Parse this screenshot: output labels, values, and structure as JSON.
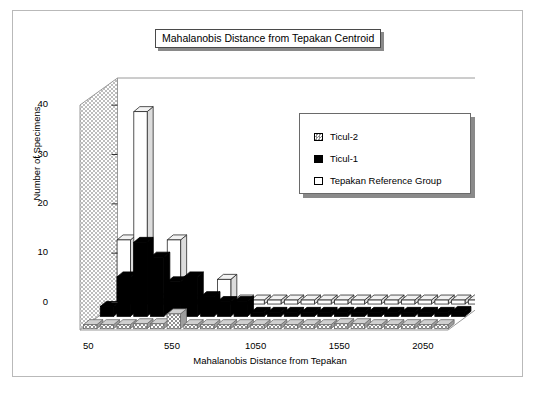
{
  "title": "Mahalanobis Distance from Tepakan Centroid",
  "legend": {
    "items": [
      {
        "label": "Ticul-2",
        "swatch": "gray-hatch",
        "color": "#b4b4b4"
      },
      {
        "label": "Ticul-1",
        "swatch": "black-solid",
        "color": "#000000"
      },
      {
        "label": "Tepakan Reference Group",
        "swatch": "white-open",
        "color": "#ffffff"
      }
    ]
  },
  "chart_data": {
    "type": "bar",
    "title": "Mahalanobis Distance from Tepakan Centroid",
    "xlabel": "Mahalanobis Distance from Tepakan",
    "ylabel": "Number of Specimens",
    "ylim": [
      0,
      45
    ],
    "yticks": [
      0,
      10,
      20,
      30,
      40
    ],
    "ytick_labels": [
      "0",
      "10",
      "20",
      "30",
      "40"
    ],
    "xticks": [
      50,
      550,
      1050,
      1550,
      2050
    ],
    "xtick_labels": [
      "50",
      "550",
      "1050",
      "1550",
      "2050"
    ],
    "grid": false,
    "legend_position": "upper-right",
    "projection": "3d-rows",
    "bin_width": 100,
    "categories": [
      50,
      150,
      250,
      350,
      450,
      550,
      650,
      750,
      850,
      950,
      1050,
      1150,
      1250,
      1350,
      1450,
      1550,
      1650,
      1750,
      1850,
      1950,
      2050,
      2150
    ],
    "series": [
      {
        "name": "Tepakan Reference Group",
        "row": "back",
        "color": "#ffffff",
        "values": [
          13,
          39,
          1,
          13,
          0,
          0,
          5,
          0,
          0,
          0,
          0,
          0,
          0,
          0,
          0,
          0,
          0,
          0,
          0,
          0,
          0,
          0
        ]
      },
      {
        "name": "Ticul-1",
        "row": "middle",
        "color": "#000000",
        "values": [
          2,
          8,
          15,
          12,
          7,
          8,
          4,
          3,
          3,
          0,
          0,
          0,
          0,
          0,
          0,
          0,
          0,
          0,
          0,
          0,
          0,
          1
        ]
      },
      {
        "name": "Ticul-2",
        "row": "front",
        "color": "#b4b4b4",
        "values": [
          0,
          0,
          0,
          1,
          1,
          3,
          0,
          0,
          0,
          0,
          0,
          0,
          0,
          0,
          0,
          1,
          1,
          0,
          0,
          0,
          0,
          0
        ]
      }
    ]
  }
}
